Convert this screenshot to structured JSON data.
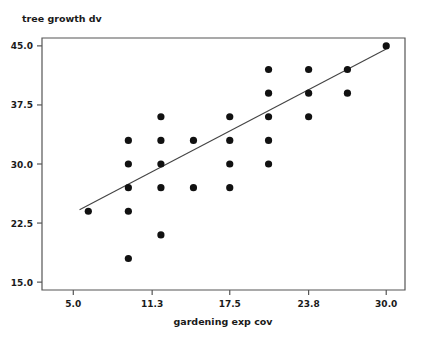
{
  "chart_data": {
    "type": "scatter",
    "title": "",
    "ylabel": "tree growth dv",
    "xlabel": "gardening exp cov",
    "xlim": [
      2.5,
      31.5
    ],
    "ylim": [
      14.0,
      46.0
    ],
    "grid": false,
    "legend": "none",
    "xticks": [
      "5.0",
      "11.3",
      "17.5",
      "23.8",
      "30.0"
    ],
    "xtick_values": [
      5.0,
      11.3,
      17.5,
      23.8,
      30.0
    ],
    "yticks": [
      "15.0",
      "22.5",
      "30.0",
      "37.5",
      "45.0"
    ],
    "ytick_values": [
      15.0,
      22.5,
      30.0,
      37.5,
      45.0
    ],
    "marker": "filled-circle",
    "marker_color": "#111111",
    "points": [
      {
        "x": 6.2,
        "y": 24.0
      },
      {
        "x": 9.4,
        "y": 33.0
      },
      {
        "x": 9.4,
        "y": 30.0
      },
      {
        "x": 9.4,
        "y": 27.0
      },
      {
        "x": 9.4,
        "y": 24.0
      },
      {
        "x": 9.4,
        "y": 18.0
      },
      {
        "x": 12.0,
        "y": 36.0
      },
      {
        "x": 12.0,
        "y": 33.0
      },
      {
        "x": 12.0,
        "y": 30.0
      },
      {
        "x": 12.0,
        "y": 27.0
      },
      {
        "x": 12.0,
        "y": 21.0
      },
      {
        "x": 14.6,
        "y": 33.0
      },
      {
        "x": 14.6,
        "y": 27.0
      },
      {
        "x": 17.5,
        "y": 36.0
      },
      {
        "x": 17.5,
        "y": 33.0
      },
      {
        "x": 17.5,
        "y": 30.0
      },
      {
        "x": 17.5,
        "y": 27.0
      },
      {
        "x": 20.6,
        "y": 42.0
      },
      {
        "x": 20.6,
        "y": 39.0
      },
      {
        "x": 20.6,
        "y": 36.0
      },
      {
        "x": 20.6,
        "y": 33.0
      },
      {
        "x": 20.6,
        "y": 30.0
      },
      {
        "x": 23.8,
        "y": 42.0
      },
      {
        "x": 23.8,
        "y": 39.0
      },
      {
        "x": 23.8,
        "y": 36.0
      },
      {
        "x": 26.9,
        "y": 42.0
      },
      {
        "x": 26.9,
        "y": 39.0
      },
      {
        "x": 30.0,
        "y": 45.0
      }
    ],
    "fit_line": {
      "label": "regression-line",
      "x_start": 5.5,
      "y_start": 24.2,
      "x_end": 30.0,
      "y_end": 44.6,
      "color": "#444444"
    }
  },
  "plot_area": {
    "left": 42,
    "right": 405,
    "top": 38,
    "bottom": 290
  }
}
